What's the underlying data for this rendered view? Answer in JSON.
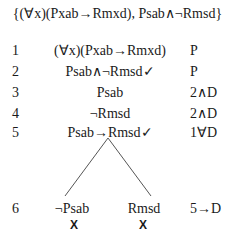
{
  "title": "{(∀x)(Pxab→Rmxd), Psab∧¬Rmsd}",
  "rows": [
    {
      "num": "1",
      "formula": "(∀x)(Pxab→Rmxd)",
      "justification": "P"
    },
    {
      "num": "2",
      "formula": "Psab∧¬Rmsd✓",
      "justification": "P"
    },
    {
      "num": "3",
      "formula": "Psab",
      "justification": "2∧D"
    },
    {
      "num": "4",
      "formula": "¬Rmsd",
      "justification": "2∧D"
    },
    {
      "num": "5",
      "formula": "Psab→Rmsd✓",
      "justification": "1∀D"
    }
  ],
  "branch_row": {
    "num": "6",
    "left": "¬Psab",
    "right": "Rmsd",
    "justification": "5→D",
    "left_closed": "X",
    "right_closed": "X"
  }
}
